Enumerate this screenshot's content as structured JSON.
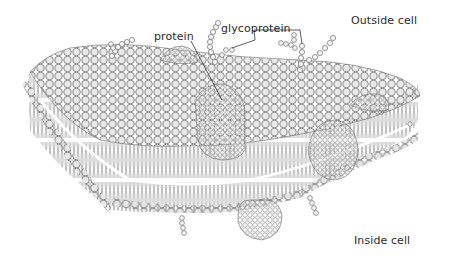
{
  "figure": {
    "labels": {
      "protein": "protein",
      "glycoprotein": "glycoprotein",
      "outside": "Outside cell",
      "inside": "Inside cell"
    },
    "colors": {
      "background": "#ffffff",
      "head_fill": "#e6e6e6",
      "head_stroke": "#6e6e6e",
      "tail_stroke": "#8a8a8a",
      "label_text": "#2a2a2a",
      "leader_line": "#333333"
    }
  }
}
